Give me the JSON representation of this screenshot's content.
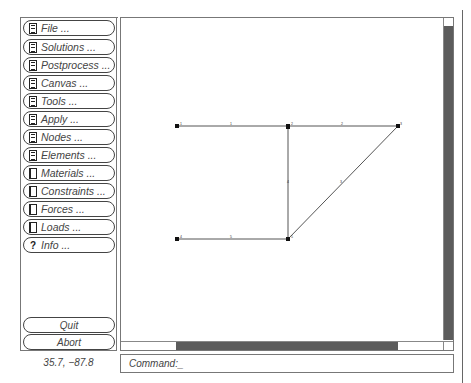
{
  "sidebar": {
    "menu_items": [
      {
        "label": "File ...",
        "icon": "document-lines-icon"
      },
      {
        "label": "Solutions ...",
        "icon": "document-lines-icon"
      },
      {
        "label": "Postprocess ...",
        "icon": "document-lines-icon"
      },
      {
        "label": "Canvas ...",
        "icon": "document-lines-icon"
      },
      {
        "label": "Tools ...",
        "icon": "document-lines-icon"
      },
      {
        "label": "Apply ...",
        "icon": "document-lines-icon"
      },
      {
        "label": "Nodes ...",
        "icon": "document-lines-icon"
      },
      {
        "label": "Elements ...",
        "icon": "document-lines-icon"
      },
      {
        "label": "Materials ...",
        "icon": "document-blank-icon"
      },
      {
        "label": "Constraints ...",
        "icon": "document-blank-icon"
      },
      {
        "label": "Forces ...",
        "icon": "document-blank-icon"
      },
      {
        "label": "Loads ...",
        "icon": "document-blank-icon"
      },
      {
        "label": "Info ...",
        "icon": "question-icon",
        "glyph": "?"
      }
    ],
    "quit_label": "Quit",
    "abort_label": "Abort"
  },
  "status": {
    "coordinates": "35.7, −87.8"
  },
  "command": {
    "prompt": "Command:_"
  },
  "canvas": {
    "nodes": [
      {
        "id": "1",
        "x": 177,
        "y": 126
      },
      {
        "id": "2",
        "x": 288,
        "y": 126
      },
      {
        "id": "3",
        "x": 398,
        "y": 126
      },
      {
        "id": "4",
        "x": 177,
        "y": 239
      },
      {
        "id": "5",
        "x": 288,
        "y": 239
      }
    ],
    "elements": [
      {
        "id": "1",
        "from": "1",
        "to": "2"
      },
      {
        "id": "2",
        "from": "2",
        "to": "3"
      },
      {
        "id": "3",
        "from": "5",
        "to": "3"
      },
      {
        "id": "4",
        "from": "2",
        "to": "5"
      },
      {
        "id": "5",
        "from": "4",
        "to": "5"
      }
    ]
  },
  "colors": {
    "scroll_thumb": "#5c5c5c",
    "border": "#777777",
    "text": "#444444"
  }
}
